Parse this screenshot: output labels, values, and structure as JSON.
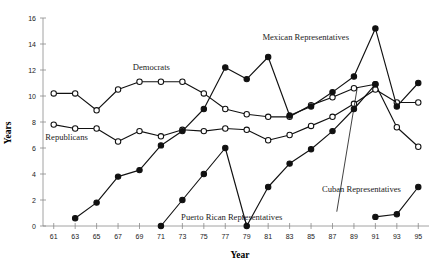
{
  "chart_data": {
    "type": "line",
    "title": "",
    "xlabel": "Year",
    "ylabel": "Years",
    "xlim": [
      60,
      96
    ],
    "ylim": [
      0,
      16
    ],
    "grid": false,
    "legend_position": "inline-annotations",
    "x_tick_labels": [
      "61",
      "63",
      "65",
      "67",
      "69",
      "71",
      "73",
      "75",
      "77",
      "79",
      "81",
      "83",
      "85",
      "87",
      "89",
      "91",
      "93",
      "95"
    ],
    "y_tick_labels": [
      "0",
      "2",
      "4",
      "6",
      "8",
      "10",
      "12",
      "14",
      "16"
    ],
    "x": [
      61,
      63,
      65,
      67,
      69,
      71,
      73,
      75,
      77,
      79,
      81,
      83,
      85,
      87,
      89,
      91,
      93,
      95
    ],
    "series": [
      {
        "name": "Democrats",
        "marker": "open-circle",
        "x": [
          61,
          63,
          65,
          67,
          69,
          71,
          73,
          75,
          77,
          79,
          81,
          83,
          85,
          87,
          89,
          91,
          93,
          95
        ],
        "values": [
          10.2,
          10.2,
          8.9,
          10.5,
          11.1,
          11.1,
          11.1,
          10.2,
          9.0,
          8.6,
          8.4,
          8.4,
          9.3,
          9.9,
          10.6,
          10.9,
          7.6,
          6.1
        ]
      },
      {
        "name": "Republicans",
        "marker": "open-circle",
        "x": [
          61,
          63,
          65,
          67,
          69,
          71,
          73,
          75,
          77,
          79,
          81,
          83,
          85,
          87,
          89,
          91,
          93,
          95
        ],
        "values": [
          7.8,
          7.5,
          7.5,
          6.5,
          7.3,
          6.9,
          7.4,
          7.3,
          7.5,
          7.4,
          6.6,
          7.0,
          7.7,
          8.4,
          9.4,
          10.5,
          9.5,
          9.5
        ]
      },
      {
        "name": "Mexican Representatives",
        "marker": "filled-circle",
        "x": [
          63,
          65,
          67,
          69,
          71,
          73,
          75,
          77,
          79,
          81,
          83,
          85,
          87,
          89,
          91,
          93,
          95
        ],
        "values": [
          0.6,
          1.8,
          3.8,
          4.3,
          6.2,
          7.3,
          9.0,
          12.2,
          11.3,
          13.0,
          8.5,
          9.2,
          10.3,
          11.5,
          15.2,
          9.2,
          11.0
        ]
      },
      {
        "name": "Puerto Rican Representatives",
        "marker": "filled-circle",
        "x": [
          71,
          73,
          75,
          77,
          79,
          81,
          83,
          85,
          87,
          89,
          91
        ],
        "values": [
          0.0,
          2.0,
          4.0,
          6.0,
          0.0,
          3.0,
          4.8,
          5.9,
          7.3,
          9.0,
          10.9
        ]
      },
      {
        "name": "Cuban Representatives",
        "marker": "filled-circle",
        "x": [
          91,
          93,
          95
        ],
        "values": [
          0.7,
          0.9,
          3.0
        ]
      }
    ],
    "annotations": [
      {
        "text": "Democrats",
        "x": 70.1,
        "y": 12.0
      },
      {
        "text": "Republicans",
        "x": 62.2,
        "y": 6.6
      },
      {
        "text": "Mexican Representatives",
        "x": 84.5,
        "y": 14.3
      },
      {
        "text": "Puerto Rican Representatives",
        "x": 77.6,
        "y": 0.45
      },
      {
        "text": "Cuban Representatives",
        "x": 89.7,
        "y": 2.6
      }
    ]
  },
  "axis": {
    "x_title": "Year",
    "y_title": "Years"
  }
}
